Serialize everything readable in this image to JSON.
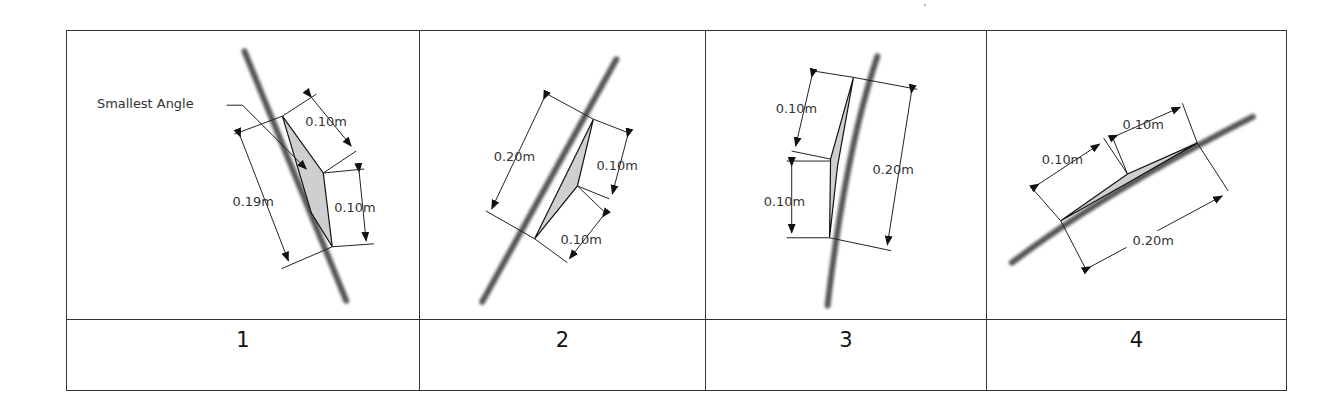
{
  "figure": {
    "panels": [
      {
        "id": 1,
        "label": "1",
        "annotation": "Smallest Angle",
        "dimensions": [
          "0.10m",
          "0.19m",
          "0.10m"
        ]
      },
      {
        "id": 2,
        "label": "2",
        "dimensions": [
          "0.20m",
          "0.10m",
          "0.10m"
        ]
      },
      {
        "id": 3,
        "label": "3",
        "dimensions": [
          "0.10m",
          "0.10m",
          "0.20m"
        ]
      },
      {
        "id": 4,
        "label": "4",
        "dimensions": [
          "0.10m",
          "0.10m",
          "0.20m"
        ]
      }
    ]
  },
  "colors": {
    "border": "#333333",
    "fill": "#cfcfcf",
    "rock_trace": "#555555",
    "text": "#333333"
  }
}
